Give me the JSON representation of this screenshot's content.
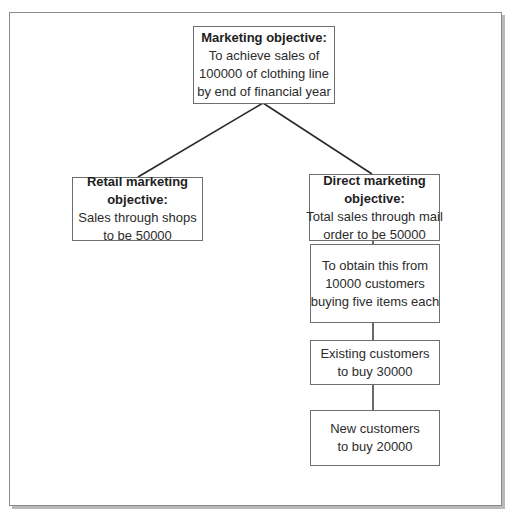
{
  "diagram": {
    "type": "hierarchy",
    "root": {
      "title": "Marketing objective:",
      "lines": [
        "To achieve sales of",
        "100000 of clothing line",
        "by end of financial year"
      ]
    },
    "branches": {
      "retail": {
        "title_lines": [
          "Retail marketing",
          "objective:"
        ],
        "lines": [
          "Sales through shops",
          "to be 50000"
        ]
      },
      "direct": {
        "title_lines": [
          "Direct marketing",
          "objective:"
        ],
        "lines": [
          "Total sales through mail",
          "order to be 50000"
        ]
      }
    },
    "direct_chain": [
      {
        "lines": [
          "To obtain this from",
          "10000 customers",
          "buying five items each"
        ]
      },
      {
        "lines": [
          "Existing customers",
          "to buy 30000"
        ]
      },
      {
        "lines": [
          "New customers",
          "to buy 20000"
        ]
      }
    ]
  },
  "colors": {
    "frame_border": "#8a8a8a",
    "frame_shadow": "#b9b9b9",
    "box_border": "#6e6e6e",
    "connector": "#2a2a2a",
    "text": "#2c2c2c"
  }
}
